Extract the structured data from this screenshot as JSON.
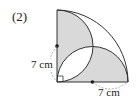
{
  "problem": {
    "number": "(2)"
  },
  "labels": {
    "left_side": "7 cm",
    "bottom_side": "7 cm"
  },
  "figure": {
    "shade_color": "#d9d9d9",
    "line_color": "#333333",
    "dash_color": "#888888"
  }
}
